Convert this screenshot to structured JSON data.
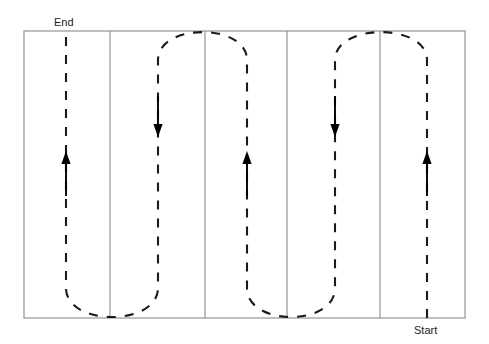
{
  "figure": {
    "title": "",
    "type": "coverage-path-diagram",
    "canvas": {
      "width": 489,
      "height": 344,
      "background": "#ffffff"
    }
  },
  "labels": {
    "end": {
      "text": "End",
      "x": 54,
      "y": 26
    },
    "start": {
      "text": "Start",
      "x": 414,
      "y": 334
    }
  },
  "colors": {
    "border": "#8a8a8a",
    "path": "#1b1b1b",
    "arrow": "#000000",
    "background": "#ffffff"
  },
  "field": {
    "name": "field-boundary",
    "x": 24,
    "y": 31,
    "width": 441,
    "height": 287
  },
  "dividers": [
    {
      "name": "swath-divider-1",
      "x": 110
    },
    {
      "name": "swath-divider-2",
      "x": 205
    },
    {
      "name": "swath-divider-3",
      "x": 287
    },
    {
      "name": "swath-divider-4",
      "x": 380
    }
  ],
  "swaths": [
    {
      "index": 1,
      "center_x": 66,
      "direction": "up"
    },
    {
      "index": 2,
      "center_x": 158,
      "direction": "down"
    },
    {
      "index": 3,
      "center_x": 247,
      "direction": "up"
    },
    {
      "index": 4,
      "center_x": 335,
      "direction": "down"
    },
    {
      "index": 5,
      "center_x": 427,
      "direction": "up"
    }
  ],
  "arrows": [
    {
      "name": "direction-arrow-swath-1",
      "x": 66,
      "y_tail": 196,
      "y_head": 151,
      "direction": "up"
    },
    {
      "name": "direction-arrow-swath-2",
      "x": 158,
      "y_tail": 96,
      "y_head": 137,
      "direction": "down"
    },
    {
      "name": "direction-arrow-swath-3",
      "x": 247,
      "y_tail": 196,
      "y_head": 151,
      "direction": "up"
    },
    {
      "name": "direction-arrow-swath-4",
      "x": 335,
      "y_tail": 96,
      "y_head": 137,
      "direction": "down"
    },
    {
      "name": "direction-arrow-swath-5",
      "x": 427,
      "y_tail": 196,
      "y_head": 151,
      "direction": "up"
    }
  ],
  "path": {
    "name": "serpentine-coverage-path",
    "style": "dashed",
    "dash_pattern": "9 9",
    "stroke_width": 2.1,
    "segments": [
      {
        "type": "line",
        "x": 427,
        "y1": 318,
        "y2": 60,
        "note": "swath 5 upward from Start"
      },
      {
        "type": "uturn",
        "side": "top",
        "from_x": 427,
        "to_x": 335,
        "y": 36,
        "note": "top turn 5 to 4"
      },
      {
        "type": "line",
        "x": 335,
        "y1": 60,
        "y2": 288,
        "note": "swath 4 downward"
      },
      {
        "type": "uturn",
        "side": "bottom",
        "from_x": 335,
        "to_x": 247,
        "y": 313,
        "note": "bottom turn 4 to 3"
      },
      {
        "type": "line",
        "x": 247,
        "y1": 288,
        "y2": 60,
        "note": "swath 3 upward"
      },
      {
        "type": "uturn",
        "side": "top",
        "from_x": 247,
        "to_x": 158,
        "y": 36,
        "note": "top turn 3 to 2"
      },
      {
        "type": "line",
        "x": 158,
        "y1": 60,
        "y2": 288,
        "note": "swath 2 downward"
      },
      {
        "type": "uturn",
        "side": "bottom",
        "from_x": 158,
        "to_x": 66,
        "y": 313,
        "note": "bottom turn 2 to 1"
      },
      {
        "type": "line",
        "x": 66,
        "y1": 288,
        "y2": 36,
        "note": "swath 1 upward to End"
      }
    ]
  }
}
